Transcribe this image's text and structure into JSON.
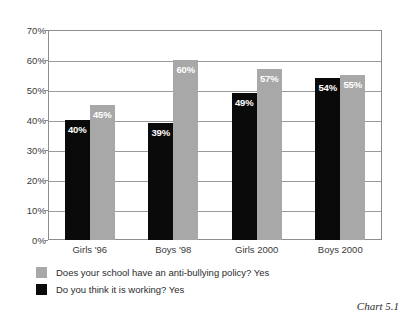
{
  "chart_data": {
    "type": "bar",
    "title": "",
    "subtitle": "",
    "xlabel": "",
    "ylabel": "",
    "ylim": [
      0,
      70
    ],
    "y_ticks": [
      "0%",
      "10%",
      "20%",
      "30%",
      "40%",
      "50%",
      "60%",
      "70%"
    ],
    "y_tick_values": [
      0,
      10,
      20,
      30,
      40,
      50,
      60,
      70
    ],
    "grid": true,
    "legend_position": "below-plot-left",
    "categories": [
      "Girls '96",
      "Boys '98",
      "Girls 2000",
      "Boys 2000"
    ],
    "series": [
      {
        "name": "Do you think it is working? Yes",
        "color": "#0a0a0a",
        "values": [
          40,
          39,
          49,
          54
        ],
        "labels": [
          "40%",
          "39%",
          "49%",
          "54%"
        ]
      },
      {
        "name": "Does your school have an anti-bullying policy? Yes",
        "color": "#a8a8a8",
        "values": [
          45,
          60,
          57,
          55
        ],
        "labels": [
          "45%",
          "60%",
          "57%",
          "55%"
        ]
      }
    ],
    "annotations": [
      "Chart 5.1"
    ]
  },
  "legend": {
    "items": [
      {
        "label": "Does your school have an anti-bullying policy? Yes",
        "swatch": "light"
      },
      {
        "label": "Do you think it is working? Yes",
        "swatch": "dark"
      }
    ]
  },
  "caption": {
    "text": "Chart 5.1"
  },
  "colors": {
    "bar_dark": "#0a0a0a",
    "bar_light": "#a8a8a8",
    "grid": "#9a9a9a",
    "frame": "#8e8e8e",
    "text": "#2b2b2b",
    "background": "#ffffff"
  }
}
